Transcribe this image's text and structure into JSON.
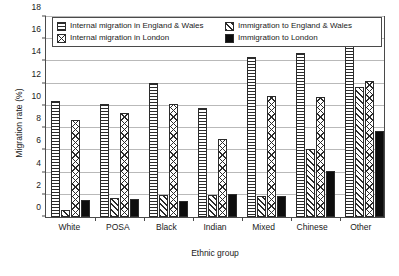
{
  "chart_data": {
    "type": "bar",
    "title": "",
    "xlabel": "Ethnic group",
    "ylabel": "Migration rate (%)",
    "ylim": [
      0,
      18
    ],
    "ytick_step": 2,
    "yticks": [
      0,
      2,
      4,
      6,
      8,
      10,
      12,
      14,
      16,
      18
    ],
    "grid": true,
    "legend_position": "top-inside",
    "categories": [
      "White",
      "POSA",
      "Black",
      "Indian",
      "Mixed",
      "Chinese",
      "Other"
    ],
    "series": [
      {
        "name": "Internal migration in England & Wales",
        "pattern": "horizontal-lines",
        "values": [
          10.4,
          10.2,
          12.1,
          9.8,
          14.4,
          14.8,
          15.6
        ]
      },
      {
        "name": "Immigration to England & Wales",
        "pattern": "diagonal-hatch",
        "values": [
          0.6,
          1.7,
          2.0,
          2.0,
          1.9,
          6.1,
          11.7
        ]
      },
      {
        "name": "Internal migration in London",
        "pattern": "cross-hatch",
        "values": [
          8.7,
          9.4,
          10.2,
          7.0,
          10.9,
          10.8,
          12.25
        ]
      },
      {
        "name": "Immigration to London",
        "pattern": "solid-black",
        "values": [
          1.55,
          1.6,
          1.4,
          2.05,
          1.9,
          4.15,
          7.7
        ]
      }
    ]
  },
  "legend": {
    "items": [
      {
        "label": "Internal migration in England & Wales",
        "swatch": "horizontal-lines-swatch"
      },
      {
        "label": "Immigration to England & Wales",
        "swatch": "diagonal-hatch-swatch"
      },
      {
        "label": "Internal migration in London",
        "swatch": "single-x-swatch"
      },
      {
        "label": "Immigration to London",
        "swatch": "solid-black-swatch"
      }
    ]
  }
}
